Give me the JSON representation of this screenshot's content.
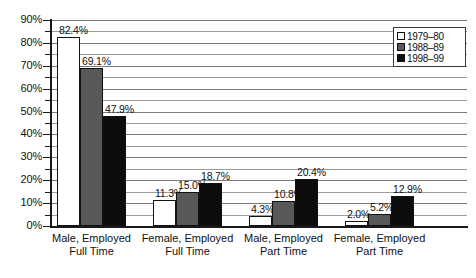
{
  "chart_data": {
    "type": "bar",
    "title": "",
    "subtitle": "",
    "xlabel": "",
    "ylabel": "",
    "ylim": [
      0,
      90
    ],
    "y_tick_step": 10,
    "y_minor_step": 5,
    "grid": true,
    "legend_position": "top-right",
    "value_format": "percent-one-decimal",
    "categories": [
      {
        "line1": "Male, Employed",
        "line2": "Full Time"
      },
      {
        "line1": "Female, Employed",
        "line2": "Full Time"
      },
      {
        "line1": "Male, Employed",
        "line2": "Part Time"
      },
      {
        "line1": "Female, Employed",
        "line2": "Part Time"
      }
    ],
    "series": [
      {
        "name": "1979–80",
        "color": "#ffffff",
        "values": [
          82.4,
          11.3,
          4.3,
          2.0
        ],
        "labels": [
          "82.4%",
          "11.3%",
          "4.3%",
          "2.0%"
        ]
      },
      {
        "name": "1988–89",
        "color": "#585858",
        "values": [
          69.1,
          15.0,
          10.8,
          5.2
        ],
        "labels": [
          "69.1%",
          "15.0%",
          "10.8%",
          "5.2%"
        ]
      },
      {
        "name": "1998–99",
        "color": "#0d0d0d",
        "values": [
          47.9,
          18.7,
          20.4,
          12.9
        ],
        "labels": [
          "47.9%",
          "18.7%",
          "20.4%",
          "12.9%"
        ]
      }
    ],
    "y_tick_labels": [
      "90%",
      "80%",
      "70%",
      "60%",
      "50%",
      "40%",
      "30%",
      "20%",
      "10%",
      "0%"
    ],
    "y_tick_values": [
      90,
      80,
      70,
      60,
      50,
      40,
      30,
      20,
      10,
      0
    ]
  },
  "legend": {
    "items": [
      {
        "label": "1979–80",
        "swatch": "white-swatch"
      },
      {
        "label": "1988–89",
        "swatch": "gray-swatch"
      },
      {
        "label": "1998–99",
        "swatch": "black-swatch"
      }
    ]
  }
}
